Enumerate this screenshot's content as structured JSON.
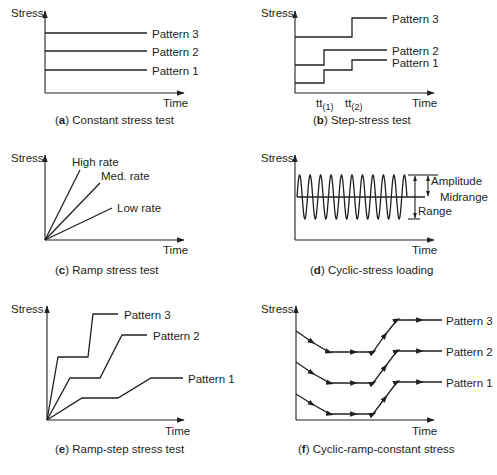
{
  "axis": {
    "y_label": "Stress",
    "x_label": "Time"
  },
  "panels": [
    {
      "id": "a",
      "letter": "a",
      "caption": " Constant stress test",
      "series": [
        "Pattern 3",
        "Pattern 2",
        "Pattern 1"
      ]
    },
    {
      "id": "b",
      "letter": "b",
      "caption": " Step-stress test",
      "series": [
        "Pattern 3",
        "Pattern 2",
        "Pattern 1"
      ],
      "ticks": [
        {
          "base": "tt",
          "sub": "(1)"
        },
        {
          "base": "tt",
          "sub": "(2)"
        }
      ]
    },
    {
      "id": "c",
      "letter": "c",
      "caption": " Ramp stress test",
      "series": [
        "High rate",
        "Med. rate",
        "Low rate"
      ]
    },
    {
      "id": "d",
      "letter": "d",
      "caption": " Cyclic-stress loading",
      "annotations": [
        "Amplitude",
        "Midrange",
        "Range"
      ]
    },
    {
      "id": "e",
      "letter": "e",
      "caption": " Ramp-step stress test",
      "series": [
        "Pattern 3",
        "Pattern 2",
        "Pattern 1"
      ]
    },
    {
      "id": "f",
      "letter": "f",
      "caption": " Cyclic-ramp-constant stress",
      "series": [
        "Pattern 3",
        "Pattern 2",
        "Pattern 1"
      ]
    }
  ],
  "colors": {
    "ink": "#231f20",
    "background": "#ffffff"
  }
}
